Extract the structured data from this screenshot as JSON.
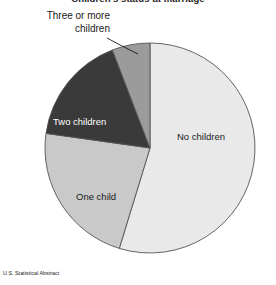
{
  "chart_data": {
    "type": "pie",
    "title": "Children's status at marriage",
    "source": "U.S. Statistical Abstract",
    "categories": [
      "No children",
      "One child",
      "Two children",
      "Three or more children"
    ],
    "values": [
      46,
      23,
      17,
      7
    ],
    "unit": "percent",
    "start_angle_deg": 0,
    "direction": "clockwise",
    "legend": "none",
    "grid": false,
    "slices": [
      {
        "label": "No children",
        "value": 46,
        "color": "#e9e9e9",
        "start_deg": 0,
        "end_deg": 197,
        "label_placement": "inside",
        "label_color": "#1a1a1a"
      },
      {
        "label": "One child",
        "value": 23,
        "color": "#c9c9c9",
        "start_deg": 197,
        "end_deg": 278,
        "label_placement": "inside",
        "label_color": "#1a1a1a"
      },
      {
        "label": "Two children",
        "value": 17,
        "color": "#3a3a3a",
        "start_deg": 278,
        "end_deg": 339,
        "label_placement": "inside",
        "label_color": "#ffffff"
      },
      {
        "label": "Three or more children",
        "value": 7,
        "color": "#9b9b9b",
        "start_deg": 339,
        "end_deg": 360,
        "label_placement": "callout",
        "label_color": "#1a1a1a"
      }
    ],
    "geometry": {
      "center_x": 150,
      "center_y": 148,
      "radius": 105,
      "stroke_color": "#555555",
      "stroke_width": 0.9
    }
  },
  "labels": {
    "no_children": "No children",
    "one_child": "One child",
    "two_children": "Two children",
    "three_or_more_line1": "Three or more",
    "three_or_more_line2": "children"
  },
  "colors": {
    "background": "#ffffff",
    "slice_no_children": "#e9e9e9",
    "slice_one_child": "#c9c9c9",
    "slice_two_children": "#3a3a3a",
    "slice_three_or_more": "#9b9b9b",
    "outline": "#555555",
    "text": "#1a1a1a",
    "text_inverted": "#ffffff"
  }
}
